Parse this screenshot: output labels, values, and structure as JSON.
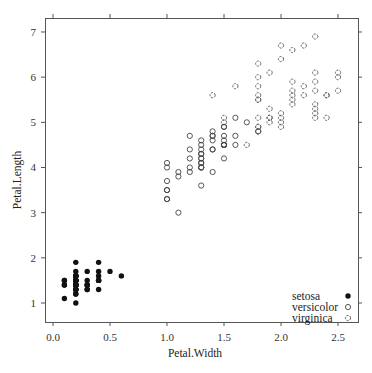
{
  "chart_data": {
    "type": "scatter",
    "title": "",
    "xlabel": "Petal.Width",
    "ylabel": "Petal.Length",
    "xlim": [
      -0.1,
      2.65
    ],
    "ylim": [
      0.6,
      7.3
    ],
    "x_ticks": [
      0.0,
      0.5,
      1.0,
      1.5,
      2.0,
      2.5
    ],
    "x_tick_labels": [
      "0.0",
      "0.5",
      "1.0",
      "1.5",
      "2.0",
      "2.5"
    ],
    "y_ticks": [
      1,
      2,
      3,
      4,
      5,
      6,
      7
    ],
    "y_tick_labels": [
      "1",
      "2",
      "3",
      "4",
      "5",
      "6",
      "7"
    ],
    "grid": false,
    "legend_position": "inside bottom-right",
    "series": [
      {
        "name": "setosa",
        "marker": "filled-circle",
        "x": [
          0.2,
          0.2,
          0.2,
          0.2,
          0.2,
          0.4,
          0.3,
          0.2,
          0.2,
          0.1,
          0.2,
          0.2,
          0.1,
          0.1,
          0.2,
          0.4,
          0.4,
          0.3,
          0.3,
          0.3,
          0.2,
          0.4,
          0.2,
          0.5,
          0.2,
          0.2,
          0.4,
          0.2,
          0.2,
          0.2,
          0.2,
          0.4,
          0.1,
          0.2,
          0.2,
          0.2,
          0.2,
          0.1,
          0.2,
          0.2,
          0.3,
          0.3,
          0.2,
          0.6,
          0.4,
          0.3,
          0.2,
          0.2,
          0.2,
          0.2
        ],
        "y": [
          1.4,
          1.4,
          1.3,
          1.5,
          1.4,
          1.7,
          1.4,
          1.5,
          1.4,
          1.5,
          1.5,
          1.6,
          1.4,
          1.1,
          1.2,
          1.5,
          1.3,
          1.4,
          1.7,
          1.5,
          1.7,
          1.5,
          1.0,
          1.7,
          1.9,
          1.6,
          1.6,
          1.5,
          1.4,
          1.6,
          1.6,
          1.5,
          1.5,
          1.4,
          1.5,
          1.2,
          1.3,
          1.4,
          1.3,
          1.5,
          1.3,
          1.3,
          1.3,
          1.6,
          1.9,
          1.4,
          1.6,
          1.4,
          1.5,
          1.4
        ]
      },
      {
        "name": "versicolor",
        "marker": "open-circle",
        "x": [
          1.4,
          1.5,
          1.5,
          1.3,
          1.5,
          1.3,
          1.6,
          1.0,
          1.3,
          1.4,
          1.0,
          1.5,
          1.0,
          1.4,
          1.3,
          1.4,
          1.5,
          1.0,
          1.5,
          1.1,
          1.8,
          1.3,
          1.5,
          1.2,
          1.3,
          1.4,
          1.4,
          1.7,
          1.5,
          1.0,
          1.1,
          1.0,
          1.2,
          1.6,
          1.5,
          1.6,
          1.5,
          1.3,
          1.3,
          1.3,
          1.2,
          1.4,
          1.2,
          1.0,
          1.3,
          1.2,
          1.3,
          1.3,
          1.1,
          1.3
        ],
        "y": [
          4.7,
          4.5,
          4.9,
          4.0,
          4.6,
          4.5,
          4.7,
          3.3,
          4.6,
          3.9,
          3.5,
          4.2,
          4.0,
          4.7,
          3.6,
          4.4,
          4.5,
          4.1,
          4.5,
          3.9,
          4.8,
          4.0,
          4.9,
          4.7,
          4.3,
          4.4,
          4.8,
          5.0,
          4.5,
          3.5,
          3.8,
          3.7,
          3.9,
          5.1,
          4.5,
          4.5,
          4.7,
          4.4,
          4.1,
          4.0,
          4.4,
          4.6,
          4.0,
          3.3,
          4.2,
          4.2,
          4.2,
          4.3,
          3.0,
          4.1
        ]
      },
      {
        "name": "virginica",
        "marker": "dashed-open-circle",
        "x": [
          2.5,
          1.9,
          2.1,
          1.8,
          2.2,
          2.1,
          1.7,
          1.8,
          1.8,
          2.5,
          2.0,
          1.9,
          2.1,
          2.0,
          2.4,
          2.3,
          1.8,
          2.2,
          2.3,
          1.5,
          2.3,
          2.0,
          2.0,
          1.8,
          2.1,
          1.8,
          1.8,
          1.8,
          2.1,
          1.6,
          1.9,
          2.0,
          2.2,
          1.5,
          1.4,
          2.3,
          2.4,
          1.8,
          1.8,
          2.1,
          2.4,
          2.3,
          1.9,
          2.3,
          2.5,
          2.3,
          1.9,
          2.0,
          2.3,
          1.8
        ],
        "y": [
          6.0,
          5.1,
          5.9,
          5.6,
          5.8,
          6.6,
          4.5,
          6.3,
          5.8,
          6.1,
          5.1,
          5.3,
          5.5,
          5.0,
          5.1,
          5.3,
          5.5,
          6.7,
          6.9,
          5.0,
          5.7,
          4.9,
          6.7,
          4.9,
          5.7,
          6.0,
          4.8,
          4.9,
          5.6,
          5.8,
          6.1,
          6.4,
          5.6,
          5.1,
          5.6,
          6.1,
          5.6,
          5.5,
          4.8,
          5.4,
          5.6,
          5.1,
          5.1,
          5.9,
          5.7,
          5.2,
          5.0,
          5.2,
          5.4,
          5.1
        ]
      }
    ],
    "legend": [
      {
        "label": "setosa",
        "marker": "filled-circle"
      },
      {
        "label": "versicolor",
        "marker": "open-circle"
      },
      {
        "label": "virginica",
        "marker": "dashed-open-circle"
      }
    ]
  }
}
